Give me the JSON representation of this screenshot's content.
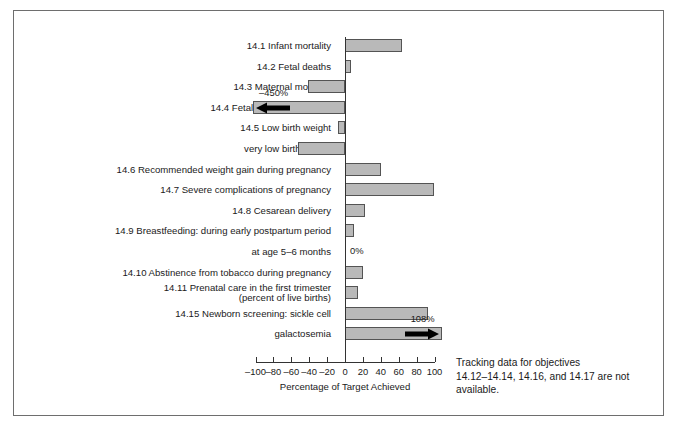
{
  "chart_data": {
    "type": "bar",
    "orientation": "horizontal",
    "title": "",
    "xlabel": "Percentage of Target Achieved",
    "ylabel": "",
    "xlim": [
      -100,
      100
    ],
    "xticks": [
      -100,
      -80,
      -60,
      -40,
      -20,
      0,
      20,
      40,
      60,
      80,
      100
    ],
    "xticklabels": [
      "–100",
      "–80",
      "–60",
      "–40",
      "–20",
      "0",
      "20",
      "40",
      "60",
      "80",
      "100"
    ],
    "grid": false,
    "legend": null,
    "bar_color": "#b9b9b9",
    "bar_edge_color": "#545454",
    "categories": [
      "14.1 Infant mortality",
      "14.2 Fetal deaths",
      "14.3 Maternal mortality",
      "14.4 Fetal alcohol syndrome",
      "14.5 Low birth weight",
      "very low birth weight",
      "14.6 Recommended weight gain during pregnancy",
      "14.7 Severe complications of pregnancy",
      "14.8 Cesarean delivery",
      "14.9 Breastfeeding: during early postpartum period",
      "at age 5–6 months",
      "14.10 Abstinence from tobacco during pregnancy",
      "14.11 Prenatal care in the first trimester (percent of live births)",
      "14.15 Newborn screening: sickle cell",
      "galactosemia"
    ],
    "values": [
      64,
      7,
      -41,
      -450,
      -8,
      -52,
      40,
      99,
      22,
      10,
      0,
      20,
      14,
      93,
      108
    ],
    "annotations": [
      {
        "label": "–450%",
        "category": "14.4 Fetal alcohol syndrome",
        "value": -450,
        "clipped": true,
        "arrow": "left"
      },
      {
        "label": "0%",
        "category": "at age 5–6 months",
        "value": 0,
        "clipped": false,
        "arrow": "none"
      },
      {
        "label": "108%",
        "category": "galactosemia",
        "value": 108,
        "clipped": true,
        "arrow": "right"
      }
    ],
    "note": "Tracking data for objectives 14.12–14.14, 14.16, and 14.17 are not available."
  },
  "rows": [
    {
      "label": "14.1 Infant mortality",
      "label2": "",
      "value": 64
    },
    {
      "label": "14.2 Fetal deaths",
      "label2": "",
      "value": 7
    },
    {
      "label": "14.3 Maternal mortality",
      "label2": "",
      "value": -41
    },
    {
      "label": "14.4 Fetal alcohol syndrome",
      "label2": "",
      "value": -450
    },
    {
      "label": "14.5 Low birth weight",
      "label2": "",
      "value": -8
    },
    {
      "label": "very low birth weight",
      "label2": "",
      "value": -52
    },
    {
      "label": "14.6 Recommended weight gain during pregnancy",
      "label2": "",
      "value": 40
    },
    {
      "label": "14.7 Severe complications of pregnancy",
      "label2": "",
      "value": 99
    },
    {
      "label": "14.8 Cesarean delivery",
      "label2": "",
      "value": 22
    },
    {
      "label": "14.9 Breastfeeding: during early postpartum period",
      "label2": "",
      "value": 10
    },
    {
      "label": "at age 5–6 months",
      "label2": "",
      "value": 0
    },
    {
      "label": "14.10 Abstinence from tobacco during pregnancy",
      "label2": "",
      "value": 20
    },
    {
      "label": "14.11 Prenatal care in the first trimester",
      "label2": "(percent of live births)",
      "value": 14
    },
    {
      "label": "14.15 Newborn screening: sickle cell",
      "label2": "",
      "value": 93
    },
    {
      "label": "galactosemia",
      "label2": "",
      "value": 108
    }
  ],
  "annotations": {
    "fetal_alcohol": "–450%",
    "zero_value": "0%",
    "galactosemia": "108%"
  },
  "axis": {
    "title": "Percentage of Target Achieved",
    "ticks": [
      "–100",
      "–80",
      "–60",
      "–40",
      "–20",
      "0",
      "20",
      "40",
      "60",
      "80",
      "100"
    ]
  },
  "side_note": {
    "line1": "Tracking data for objectives",
    "line2": "14.12–14.14, 14.16, and 14.17 are not",
    "line3": "available."
  }
}
